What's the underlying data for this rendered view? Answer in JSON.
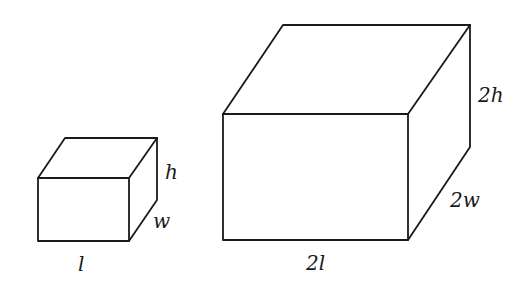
{
  "figure": {
    "small_box": {
      "labels": {
        "length": "l",
        "width": "w",
        "height": "h"
      }
    },
    "large_box": {
      "labels": {
        "length": "2l",
        "width": "2w",
        "height": "2h"
      }
    },
    "colors": {
      "stroke": "#1a1a1a",
      "background": "#ffffff"
    }
  }
}
